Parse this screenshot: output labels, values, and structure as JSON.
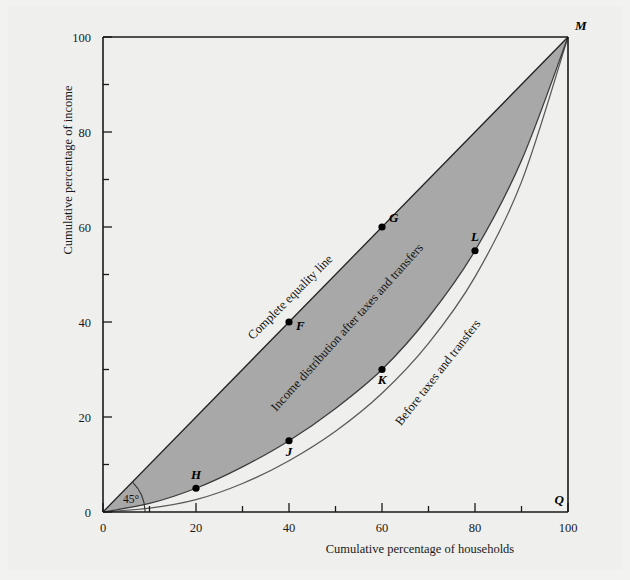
{
  "figure": {
    "background_color": "#efefed",
    "shade_color": "#a8a8a8",
    "line_color": "#4a4a4a",
    "axis_color": "#1a1a1a"
  },
  "axes": {
    "x": {
      "title": "Cumulative percentage of households",
      "labels": [
        "0",
        "20",
        "40",
        "60",
        "80",
        "100"
      ],
      "label_values": [
        0,
        20,
        40,
        60,
        80,
        100
      ],
      "ticks": [
        0,
        10,
        20,
        30,
        40,
        50,
        60,
        70,
        80,
        90,
        100
      ],
      "min": 0,
      "max": 100
    },
    "y": {
      "title": "Cumulative percentage of income",
      "labels": [
        "0",
        "20",
        "40",
        "60",
        "80",
        "100"
      ],
      "label_values": [
        0,
        20,
        40,
        60,
        80,
        100
      ],
      "ticks": [
        0,
        10,
        20,
        30,
        40,
        50,
        60,
        70,
        80,
        90,
        100
      ],
      "min": 0,
      "max": 100
    }
  },
  "annotations": {
    "angle": "45°",
    "equality_line_label": "Complete equality line",
    "after_curve_label": "Income distribution after taxes and transfers",
    "before_curve_label": "Before taxes and transfers"
  },
  "points": [
    {
      "id": "M",
      "label": "M",
      "x": 100,
      "y": 100,
      "curve": "equality"
    },
    {
      "id": "G",
      "label": "G",
      "x": 60,
      "y": 60,
      "curve": "equality"
    },
    {
      "id": "F",
      "label": "F",
      "x": 40,
      "y": 40,
      "curve": "equality"
    },
    {
      "id": "Q",
      "label": "Q",
      "x": 100,
      "y": 0,
      "curve": "axis"
    },
    {
      "id": "L",
      "label": "L",
      "x": 80,
      "y": 55,
      "curve": "after"
    },
    {
      "id": "K",
      "label": "K",
      "x": 60,
      "y": 30,
      "curve": "after"
    },
    {
      "id": "J",
      "label": "J",
      "x": 40,
      "y": 15,
      "curve": "after"
    },
    {
      "id": "H",
      "label": "H",
      "x": 20,
      "y": 5,
      "curve": "after"
    }
  ],
  "chart_data": {
    "type": "line",
    "title": "",
    "xlabel": "Cumulative percentage of households",
    "ylabel": "Cumulative percentage of income",
    "xlim": [
      0,
      100
    ],
    "ylim": [
      0,
      100
    ],
    "grid": false,
    "legend_position": "inline-labels",
    "series": [
      {
        "name": "Complete equality line",
        "x": [
          0,
          100
        ],
        "values": [
          0,
          100
        ],
        "style": "straight-45-degree",
        "marked_points": [
          {
            "label": "F",
            "x": 40,
            "y": 40
          },
          {
            "label": "G",
            "x": 60,
            "y": 60
          },
          {
            "label": "M",
            "x": 100,
            "y": 100
          }
        ]
      },
      {
        "name": "Income distribution after taxes and transfers",
        "x": [
          0,
          10,
          20,
          30,
          40,
          50,
          60,
          70,
          80,
          90,
          100
        ],
        "values": [
          0,
          1.8,
          5,
          9.5,
          15,
          21.8,
          30,
          41,
          55,
          74,
          100
        ],
        "style": "lorenz-curve",
        "marked_points": [
          {
            "label": "H",
            "x": 20,
            "y": 5
          },
          {
            "label": "J",
            "x": 40,
            "y": 15
          },
          {
            "label": "K",
            "x": 60,
            "y": 30
          },
          {
            "label": "L",
            "x": 80,
            "y": 55
          },
          {
            "label": "M",
            "x": 100,
            "y": 100
          }
        ]
      },
      {
        "name": "Before taxes and transfers",
        "x": [
          0,
          10,
          20,
          30,
          40,
          50,
          60,
          70,
          80,
          90,
          100
        ],
        "values": [
          0,
          0.8,
          2.6,
          6.0,
          10.8,
          17.0,
          25.0,
          35.5,
          49.5,
          69.5,
          100
        ],
        "style": "lorenz-curve",
        "marked_points": []
      }
    ],
    "shaded_region": {
      "description": "Area between complete equality line and income distribution after taxes and transfers",
      "color": "#a8a8a8"
    },
    "annotations": [
      {
        "text": "45°",
        "x": 5,
        "y": 2
      },
      {
        "text": "Q",
        "x": 100,
        "y": 0
      },
      {
        "text": "M",
        "x": 100,
        "y": 100
      }
    ]
  }
}
